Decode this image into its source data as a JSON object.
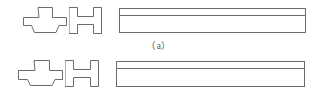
{
  "figure": {
    "background_color": "#ffffff",
    "line_color": "#6b6b6b",
    "text_color": "#59595a",
    "rows": [
      {
        "id": "a",
        "caption": "（a）",
        "caption_plain": "(a)",
        "profiles": [
          {
            "name": "cross-shaped-profile",
            "label": "cross profile",
            "type": "cruciform",
            "x": 23,
            "y": 7,
            "width": 42,
            "height": 26,
            "flange_width": 42,
            "flange_height": 9,
            "stem_width": 13,
            "stem_height": 17
          },
          {
            "name": "h-beam-profile",
            "label": "H profile",
            "type": "i-beam",
            "x": 69,
            "y": 7,
            "width": 33,
            "height": 27,
            "flange_width": 8,
            "web_height": 8
          }
        ],
        "bar": {
          "name": "long-bar-elevation",
          "x": 119,
          "y": 8,
          "width": 186,
          "height": 24,
          "divider_offset": 7,
          "segments": [
            {
              "label": "top-flange-strip",
              "height": 7
            },
            {
              "label": "web-face",
              "height": 17
            }
          ]
        }
      },
      {
        "id": "b",
        "caption": "（b）",
        "caption_plain": "(b)",
        "profiles": [
          {
            "name": "cross-shaped-profile",
            "label": "cross profile",
            "type": "cruciform",
            "x": 18,
            "y": 60,
            "width": 44,
            "height": 26,
            "flange_width": 44,
            "flange_height": 10,
            "stem_width": 14,
            "stem_height": 16
          },
          {
            "name": "h-beam-profile",
            "label": "H profile",
            "type": "i-beam",
            "x": 65,
            "y": 60,
            "width": 34,
            "height": 27,
            "flange_width": 8,
            "web_height": 8
          }
        ],
        "bar": {
          "name": "long-bar-elevation",
          "x": 116,
          "y": 61,
          "width": 188,
          "height": 25,
          "divider_offset": 7,
          "segments": [
            {
              "label": "top-flange-strip",
              "height": 7
            },
            {
              "label": "web-face",
              "height": 18
            }
          ]
        }
      }
    ]
  }
}
